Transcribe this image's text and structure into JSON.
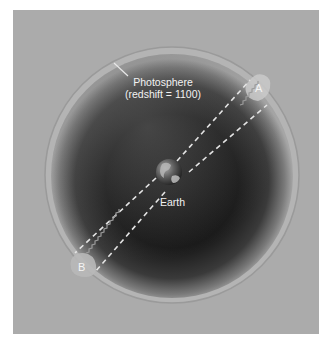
{
  "figure": {
    "type": "diagram",
    "labels": {
      "photosphere_line1": "Photosphere",
      "photosphere_line2": "(redshift = 1100)",
      "earth": "Earth",
      "region_a": "A",
      "region_b": "B"
    },
    "colors": {
      "background_panel": "#ababab",
      "sphere_dark": "#141414",
      "photosphere_ring": "#b9b9b9",
      "dashed_line": "#e6e6e6",
      "label_text": "#f2f2f2"
    }
  }
}
